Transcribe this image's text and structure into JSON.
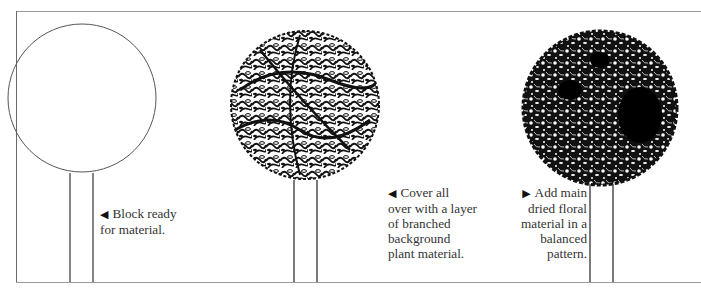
{
  "figure": {
    "steps": [
      {
        "id": "step1",
        "arrow": "◀",
        "lines": [
          "Block ready",
          "for material."
        ],
        "fill": "empty"
      },
      {
        "id": "step2",
        "arrow": "◀",
        "lines": [
          "Cover all",
          "over with a layer",
          "of branched",
          "background",
          "plant material."
        ],
        "fill": "branched-foliage"
      },
      {
        "id": "step3",
        "arrow": "▶",
        "lines": [
          "Add main",
          "dried floral",
          "material in a",
          "balanced",
          "pattern."
        ],
        "fill": "dense-floral"
      }
    ]
  },
  "colors": {
    "ink": "#111111",
    "frame": "#9a9a9a",
    "paper": "#ffffff"
  }
}
